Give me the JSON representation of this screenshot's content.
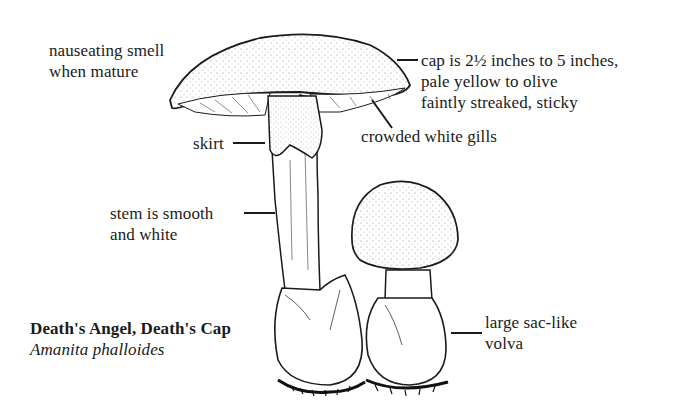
{
  "figure": {
    "common_name": "Death's Angel, Death's Cap",
    "scientific_name": "Amanita phalloides"
  },
  "annotations": {
    "smell": [
      "nauseating smell",
      "when mature"
    ],
    "cap": [
      "cap is 2½ inches to 5 inches,",
      "pale yellow to olive",
      "faintly streaked, sticky"
    ],
    "gills": "crowded white gills",
    "skirt": "skirt",
    "stem": [
      "stem is smooth",
      "and white"
    ],
    "volva": [
      "large sac-like",
      "volva"
    ]
  },
  "colors": {
    "ink": "#1a1a1a",
    "background": "#ffffff"
  }
}
